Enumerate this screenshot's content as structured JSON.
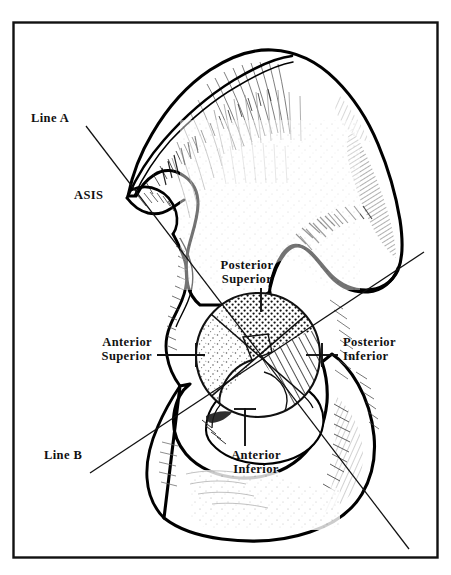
{
  "figure": {
    "border_color": "#111111",
    "background_color": "#ffffff",
    "ink_color": "#000000"
  },
  "labels": {
    "line_a": "Line A",
    "asis": "ASIS",
    "posterior_superior": "Posterior\nSuperior",
    "anterior_superior": "Anterior\nSuperior",
    "posterior_inferior": "Posterior\nInferior",
    "anterior_inferior": "Anterior\nInferior",
    "line_b": "Line B"
  },
  "quadrants": [
    {
      "name": "posterior-superior",
      "label": "Posterior Superior",
      "fill": "dense-dots",
      "position": "top"
    },
    {
      "name": "posterior-inferior",
      "label": "Posterior Inferior",
      "fill": "diagonal-hatch",
      "position": "right"
    },
    {
      "name": "anterior-superior",
      "label": "Anterior Superior",
      "fill": "sparse-stipple",
      "position": "left"
    },
    {
      "name": "anterior-inferior",
      "label": "Anterior Inferior",
      "fill": "blank",
      "position": "bottom"
    }
  ],
  "reference_lines": [
    {
      "name": "line-a",
      "label": "Line A",
      "from_label": "ASIS",
      "direction": "upper-left to lower-right"
    },
    {
      "name": "line-b",
      "label": "Line B",
      "direction": "lower-left to upper-right"
    }
  ],
  "acetabulum": {
    "center_x": 258,
    "center_y": 355,
    "radius": 62
  }
}
